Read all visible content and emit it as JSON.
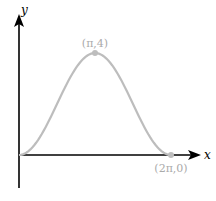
{
  "chart_data": {
    "type": "line",
    "title": "",
    "xlabel": "x",
    "ylabel": "y",
    "series": [
      {
        "name": "curve",
        "function": "2 - 2cos(x)",
        "domain": [
          0,
          6.2832
        ],
        "color": "#bdbdbd"
      }
    ],
    "points": [
      {
        "label": "(π,4)",
        "x": 3.1416,
        "y": 4
      },
      {
        "label": "(2π,0)",
        "x": 6.2832,
        "y": 0
      }
    ],
    "xlim": [
      0,
      7.2
    ],
    "ylim": [
      -1.3,
      5.2
    ],
    "grid": false,
    "legend": "none"
  },
  "axes": {
    "x_label": "x",
    "y_label": "y",
    "axis_color": "#000000"
  },
  "annotations": {
    "peak": "(π,4)",
    "end": "(2π,0)",
    "label_color": "#aaaaaa"
  }
}
